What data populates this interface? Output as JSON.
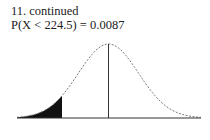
{
  "header": {
    "problem": "11.  continued",
    "probability": "P(X < 224.5) = 0.0087"
  },
  "chart_data": {
    "type": "area",
    "title": "P(X < 224.5) = 0.0087",
    "shaded_region": "left tail, X < 224.5",
    "shaded_probability": 0.0087,
    "cutoff": 224.5,
    "mean_line": true,
    "xlabel": "",
    "ylabel": "",
    "tick_labels": [],
    "curve_style": "dashed",
    "grid": false,
    "colors": {
      "curve": "#777777",
      "shade": "#111111",
      "axis": "#333333"
    }
  }
}
